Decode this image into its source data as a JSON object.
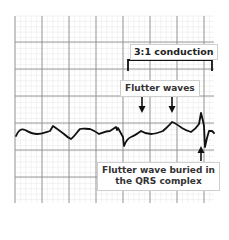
{
  "annotations": {
    "conduction_label": "3:1 conduction",
    "flutter_waves_label": "Flutter waves",
    "buried_label_line1": "Flutter wave buried in",
    "buried_label_line2": "the QRS complex"
  },
  "colors": {
    "minor_grid": "#e4e4e4",
    "major_grid": "#8a8a8a",
    "trace": "#111111",
    "label_border": "#cfcfcf"
  },
  "grid": {
    "x_start": 15,
    "x_end": 214,
    "y_start": 16,
    "y_end": 203,
    "major_spacing": 27,
    "minor_spacing": 5.4
  }
}
